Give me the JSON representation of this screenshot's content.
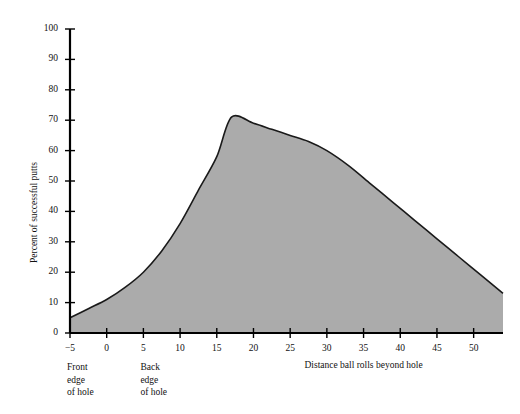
{
  "chart_data": {
    "type": "area",
    "title": "",
    "xlabel": "Distance ball rolls beyond hole",
    "ylabel": "Percent of successful putts",
    "xlim": [
      -5,
      54
    ],
    "ylim": [
      0,
      100
    ],
    "grid": false,
    "legend": null,
    "x_ticks": [
      -5,
      0,
      5,
      10,
      15,
      20,
      25,
      30,
      35,
      40,
      45,
      50
    ],
    "x_tick_labels": [
      "−5",
      "0",
      "5",
      "10",
      "15",
      "20",
      "25",
      "30",
      "35",
      "40",
      "45",
      "50"
    ],
    "y_ticks": [
      0,
      10,
      20,
      30,
      40,
      50,
      60,
      70,
      80,
      90,
      100
    ],
    "y_tick_labels": [
      "0",
      "10",
      "20",
      "30",
      "40",
      "50",
      "60",
      "70",
      "80",
      "90",
      "100"
    ],
    "series": [
      {
        "name": "Percent of successful putts",
        "fill_color": "#ababab",
        "line_color": "#1a1a1a",
        "x": [
          -5,
          -2.5,
          0,
          2.5,
          5,
          7.5,
          10,
          12.5,
          15,
          17,
          20,
          22.5,
          25,
          27.5,
          30,
          33,
          36,
          39,
          42,
          45,
          48,
          51,
          54
        ],
        "y": [
          5,
          8,
          11,
          15,
          20,
          27,
          36,
          47,
          58,
          71,
          69,
          67,
          65,
          63,
          60,
          55,
          49,
          43,
          37,
          31,
          25,
          19,
          13
        ]
      }
    ],
    "annotations": [
      {
        "name": "front-edge-of-hole",
        "text": "Front\nedge\nof hole",
        "x_value": -5
      },
      {
        "name": "back-edge-of-hole",
        "text": "Back\nedge\nof hole",
        "x_value": 5
      }
    ],
    "colors": {
      "fill": "#ababab",
      "line": "#1a1a1a",
      "axis": "#000000",
      "background": "#ffffff"
    }
  }
}
